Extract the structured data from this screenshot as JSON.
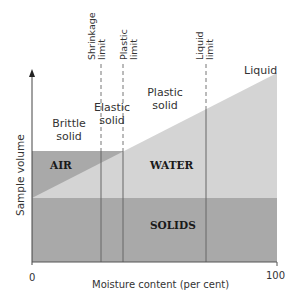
{
  "diagram": {
    "type": "soil consistency / phase diagram",
    "axes": {
      "y_label": "Sample volume",
      "x_label": "Moisture content (per cent)",
      "x_min_tick": "0",
      "x_max_tick": "100"
    },
    "limits": [
      {
        "name": "shrinkage",
        "line1": "Shrinkage",
        "line2": "limit"
      },
      {
        "name": "plastic",
        "line1": "Plastic",
        "line2": "limit"
      },
      {
        "name": "liquid",
        "line1": "Liquid",
        "line2": "limit"
      }
    ],
    "states": [
      {
        "line1": "Brittle",
        "line2": "solid"
      },
      {
        "line1": "Elastic",
        "line2": "solid"
      },
      {
        "line1": "Plastic",
        "line2": "solid"
      },
      {
        "line1": "Liquid",
        "line2": ""
      }
    ],
    "regions": {
      "air": "AIR",
      "water": "WATER",
      "solids": "SOLIDS"
    },
    "colors": {
      "solids": "#a9a9a9",
      "air": "#a9a9a9",
      "water": "#d4d4d4",
      "lines": "#555555",
      "background": "#ffffff"
    }
  }
}
